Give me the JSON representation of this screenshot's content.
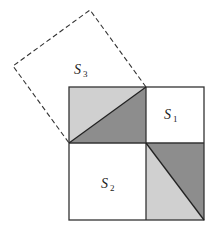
{
  "diagram": {
    "type": "pythagorean-proof-squares",
    "labels": {
      "s1": {
        "base": "S",
        "sub": "1"
      },
      "s2": {
        "base": "S",
        "sub": "2"
      },
      "s3": {
        "base": "S",
        "sub": "3"
      }
    },
    "colors": {
      "background": "#ffffff",
      "outline": "#333333",
      "dark_shade": "#8d8d8d",
      "light_shade": "#d0d0d0",
      "dashed_line": "#333333"
    },
    "outer_square": {
      "x": 69,
      "y": 87,
      "width": 135,
      "height": 133
    },
    "divider": {
      "x": 146,
      "y": 143
    },
    "dashed_square_points": "69,143 146,87 90,10 13,66"
  }
}
